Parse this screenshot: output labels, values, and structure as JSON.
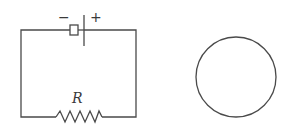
{
  "diagram": {
    "type": "circuit-schematic",
    "circuit": {
      "battery": {
        "negative_label": "−",
        "positive_label": "+"
      },
      "resistor": {
        "label": "R"
      }
    },
    "circle": {
      "description": "empty circle"
    },
    "colors": {
      "stroke": "#4a4a4a",
      "background": "#ffffff"
    }
  }
}
